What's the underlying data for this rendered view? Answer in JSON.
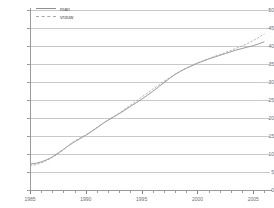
{
  "chart_data": {
    "type": "line",
    "title": "",
    "subtitle": "",
    "xlabel": "",
    "ylabel": "",
    "xlim": [
      1985,
      2006.5
    ],
    "ylim": [
      0,
      50
    ],
    "grid": true,
    "legend_position": "top-left",
    "y_ticks": [
      0,
      5,
      10,
      15,
      20,
      25,
      30,
      35,
      40,
      45,
      50
    ],
    "y_tick_labels": [
      "0",
      "5",
      "10",
      "15",
      "20",
      "25",
      "30",
      "35",
      "40",
      "45",
      "50"
    ],
    "x_ticks": [
      1985,
      1990,
      1995,
      2000,
      2005
    ],
    "x_tick_labels": [
      "1985",
      "1990",
      "1995",
      "2000",
      "2005"
    ],
    "x_minor_ticks": [
      1986,
      1987,
      1988,
      1989,
      1991,
      1992,
      1993,
      1994,
      1996,
      1997,
      1998,
      1999,
      2001,
      2002,
      2003,
      2004,
      2006
    ],
    "x": [
      1985,
      1985.5,
      1986,
      1986.5,
      1987,
      1987.5,
      1988,
      1988.5,
      1989,
      1989.5,
      1990,
      1990.5,
      1991,
      1991.5,
      1992,
      1992.5,
      1993,
      1993.5,
      1994,
      1994.5,
      1995,
      1995.5,
      1996,
      1996.5,
      1997,
      1997.5,
      1998,
      1998.5,
      1999,
      1999.5,
      2000,
      2000.5,
      2001,
      2001.5,
      2002,
      2002.5,
      2003,
      2003.5,
      2004,
      2004.5,
      2005,
      2005.5,
      2006
    ],
    "series": [
      {
        "name": "man",
        "style": "solid",
        "color": "#8f8f8f",
        "values": [
          7.2,
          7.4,
          7.8,
          8.4,
          9.2,
          10.2,
          11.3,
          12.4,
          13.4,
          14.3,
          15.2,
          16.2,
          17.3,
          18.4,
          19.4,
          20.3,
          21.2,
          22.2,
          23.2,
          24.2,
          25.2,
          26.3,
          27.4,
          28.6,
          29.8,
          31.0,
          32.1,
          33.0,
          33.8,
          34.5,
          35.2,
          35.8,
          36.4,
          36.9,
          37.4,
          37.9,
          38.4,
          38.9,
          39.3,
          39.7,
          40.1,
          40.6,
          41.2
        ]
      },
      {
        "name": "vrouw",
        "style": "dashed",
        "color": "#a8a8a8",
        "values": [
          6.8,
          7.0,
          7.5,
          8.2,
          9.0,
          10.0,
          11.2,
          12.5,
          13.6,
          14.5,
          15.3,
          16.3,
          17.4,
          18.5,
          19.5,
          20.4,
          21.4,
          22.5,
          23.6,
          24.7,
          25.8,
          26.9,
          28.0,
          29.1,
          30.2,
          31.2,
          32.2,
          33.1,
          33.9,
          34.6,
          35.3,
          35.9,
          36.5,
          37.1,
          37.6,
          38.2,
          38.8,
          39.4,
          40.0,
          40.7,
          41.5,
          42.4,
          43.4
        ]
      }
    ]
  },
  "legend": {
    "items": [
      {
        "label": "man"
      },
      {
        "label": "vrouw"
      }
    ]
  }
}
